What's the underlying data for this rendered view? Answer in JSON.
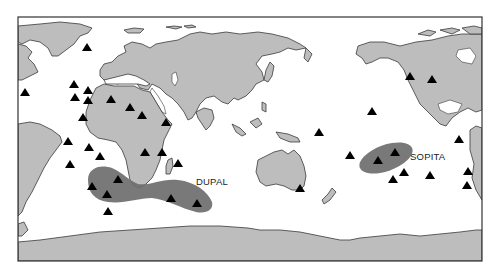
{
  "map": {
    "title": "",
    "projection": "world, Pacific-centered equirectangular",
    "colors": {
      "land": "#bdbdbd",
      "ocean": "#ffffff",
      "anomaly_region": "#6e6e6e",
      "hotspot_marker": "#000000",
      "coastline": "#3a3a3a"
    },
    "regions": [
      {
        "name": "DUPAL",
        "label": "DUPAL"
      },
      {
        "name": "SOPITA",
        "label": "SOPITA"
      }
    ],
    "marker_type": "triangle",
    "marker_count": 40
  }
}
